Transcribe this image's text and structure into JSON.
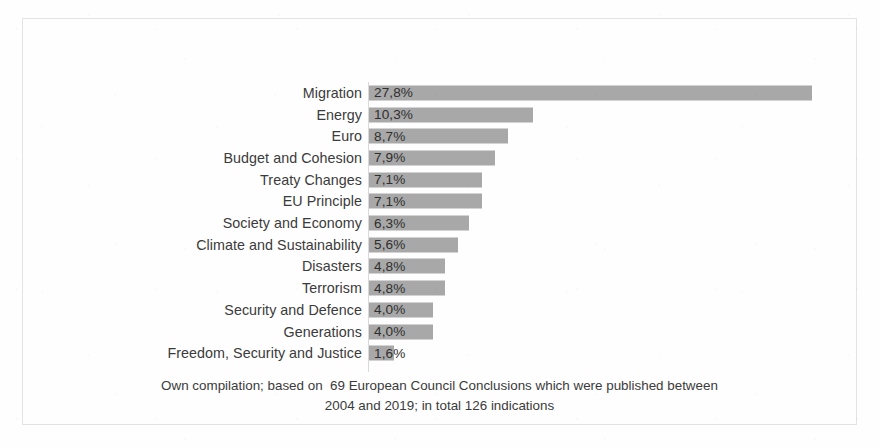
{
  "chart_data": {
    "type": "bar",
    "orientation": "horizontal",
    "title": "",
    "subtitle": "",
    "xlabel": "",
    "ylabel": "",
    "grid": false,
    "legend": null,
    "xlim": [
      0,
      30.5
    ],
    "value_suffix": "%",
    "decimal_separator": ",",
    "categories": [
      "Migration",
      "Energy",
      "Euro",
      "Budget and Cohesion",
      "Treaty Changes",
      "EU Principle",
      "Society and Economy",
      "Climate and Sustainability",
      "Disasters",
      "Terrorism",
      "Security and Defence",
      "Generations",
      "Freedom, Security and Justice"
    ],
    "values": [
      27.8,
      10.3,
      8.7,
      7.9,
      7.1,
      7.1,
      6.3,
      5.6,
      4.8,
      4.8,
      4.0,
      4.0,
      1.6
    ],
    "value_labels": [
      "27,8%",
      "10,3%",
      "8,7%",
      "7,9%",
      "7,1%",
      "7,1%",
      "6,3%",
      "5,6%",
      "4,8%",
      "4,8%",
      "4,0%",
      "4,0%",
      "1,6%"
    ],
    "bar_color": "#a8a8a8",
    "label_color": "#3b3b3b",
    "annotations": [
      "Own compilation; based on  69 European Council Conclusions which were published between",
      "2004 and 2019; in total 126 indications"
    ]
  },
  "caption": {
    "line1": "Own compilation; based on  69 European Council Conclusions which were published between",
    "line2": "2004 and 2019; in total 126 indications"
  }
}
